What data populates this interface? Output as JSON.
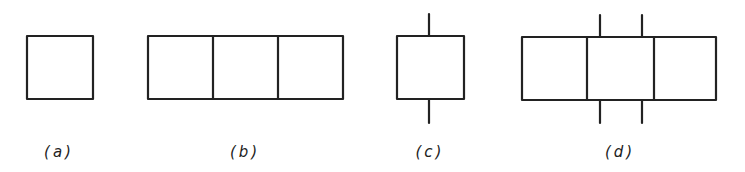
{
  "figure": {
    "stroke_color": "#222222",
    "background": "#ffffff",
    "panels": [
      {
        "id": "a",
        "label": "(a)",
        "cells": 1,
        "stubs": [],
        "description": "single square block"
      },
      {
        "id": "b",
        "label": "(b)",
        "cells": 3,
        "stubs": [],
        "description": "three adjacent square blocks in a row"
      },
      {
        "id": "c",
        "label": "(c)",
        "cells": 1,
        "stubs": [
          "top-center",
          "bottom-center"
        ],
        "description": "single square with vertical lines at top and bottom"
      },
      {
        "id": "d",
        "label": "(d)",
        "cells": 3,
        "stubs": [
          "top-left-of-middle",
          "top-right-of-middle",
          "bottom-left-of-middle",
          "bottom-right-of-middle"
        ],
        "description": "three adjacent squares with two vertical lines above and below the middle square"
      }
    ]
  }
}
